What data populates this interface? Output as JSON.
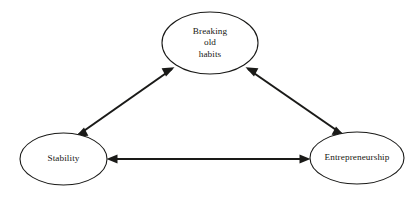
{
  "diagram": {
    "background_color": "#ffffff",
    "stroke_color": "#1a1a18",
    "text_color": "#171714",
    "nodes": [
      {
        "id": "breaking-old-habits",
        "label": "Breaking\nold\nhabits",
        "label_lines": [
          "Breaking",
          "old",
          "habits"
        ],
        "shape": "ellipse",
        "cx": 210,
        "cy": 43,
        "rx": 48,
        "ry": 31
      },
      {
        "id": "stability",
        "label": "Stability",
        "label_lines": [
          "Stability"
        ],
        "shape": "ellipse",
        "cx": 63.5,
        "cy": 159,
        "rx": 43.5,
        "ry": 26
      },
      {
        "id": "entrepreneurship",
        "label": "Entrepreneurship",
        "label_lines": [
          "Entrepreneurship"
        ],
        "shape": "ellipse",
        "cx": 357,
        "cy": 158,
        "rx": 47,
        "ry": 26
      }
    ],
    "edges": [
      {
        "id": "edge-stability-breaking",
        "from": "stability",
        "to": "breaking-old-habits",
        "direction": "bidirectional",
        "arrowheads": "both"
      },
      {
        "id": "edge-breaking-entrepreneurship",
        "from": "breaking-old-habits",
        "to": "entrepreneurship",
        "direction": "bidirectional",
        "arrowheads": "both"
      },
      {
        "id": "edge-stability-entrepreneurship",
        "from": "entrepreneurship",
        "to": "stability",
        "direction": "bidirectional",
        "arrowheads": "both"
      }
    ]
  }
}
